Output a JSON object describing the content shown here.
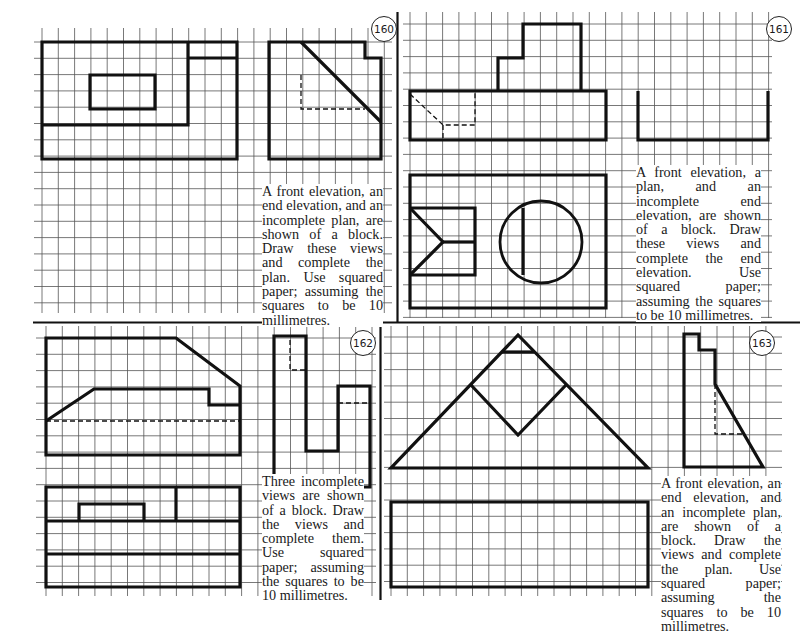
{
  "page": {
    "background": "#ffffff",
    "ink": "#111111",
    "grid_color": "#555555",
    "grid_spacing_px": 16.3
  },
  "exercises": [
    {
      "number": "160",
      "caption": "A front elevation, an end elevation, and an incomplete plan, are shown of a block. Draw these views and complete the plan. Use squared paper; assuming the squares to be 10 millimetres."
    },
    {
      "number": "161",
      "caption": "A front elevation, a plan, and an incomplete end elevation, are shown of a block. Draw these views and complete the end elevation. Use squared paper; assuming the squares to be 10 millimetres."
    },
    {
      "number": "162",
      "caption": "Three incomplete views are shown of a block. Draw the views and complete them. Use squared paper; assuming the squares to be 10 millimetres."
    },
    {
      "number": "163",
      "caption": "A front elevation, an end elevation, and an incomplete plan, are shown of a block. Draw the views and complete the plan. Use squared paper; assuming the squares to be 10 millimetres."
    }
  ],
  "grids": [
    {
      "x0": 34,
      "x1": 392,
      "y0": 28,
      "y1": 313,
      "ox": 42,
      "oy": 42
    },
    {
      "x0": 403,
      "x1": 772,
      "y0": 12,
      "y1": 318,
      "ox": 410,
      "oy": 24
    },
    {
      "x0": 36,
      "x1": 376,
      "y0": 326,
      "y1": 596,
      "ox": 46,
      "oy": 338
    },
    {
      "x0": 384,
      "x1": 782,
      "y0": 326,
      "y1": 596,
      "ox": 391,
      "oy": 337
    }
  ],
  "dividers": [
    {
      "x1": 397.5,
      "y1": 12,
      "x2": 397.5,
      "y2": 322
    },
    {
      "x1": 33,
      "y1": 322.5,
      "x2": 800,
      "y2": 322.5
    },
    {
      "x1": 380.5,
      "y1": 322,
      "x2": 380.5,
      "y2": 600
    }
  ],
  "drawing": {
    "thick": [
      "M42,42 H237 V159 H42 Z",
      "M188,42 V125 H42",
      "M188,58 H237",
      "M90,75 H155 V109 H90 Z",
      "M269,42 H365 V58 H381 V159 H269 Z",
      "M301,42 L381,122",
      "M410,91 H606 V140 H410 Z",
      "M498,91 V58 H523 V24 H581 V91",
      "M638,91 V140 H768 V91",
      "M410,175 H606 V308 H410 Z",
      "M410,208 H475 V275 H410",
      "M410,208 L443,242 L410,275",
      "M443,242 H475",
      "M523,208 V275",
      "M46,338 H176 L240,386 V455 H46 Z",
      "M46,421 L94,389 H209 V405 H240",
      "M274,336 H306 V451 H338 V386 H370 V487 H274 Z",
      "M46,487 H240 V587 H46 Z",
      "M46,521 H240",
      "M46,554 H240",
      "M79,521 V504 H144 V521",
      "M176,487 V521",
      "M518,335 L391,468 H648 Z",
      "M502,352 H534",
      "M471,385 L518,435 L566,385",
      "M684,334 H699 V350 H715 V384 L763,467 H684 Z",
      "M391,502 H648 V587 H391 Z"
    ],
    "dashed": [
      "M301,75 V109 H365",
      "M410,94 L443,125 H475 V91",
      "M443,125 V140",
      "M46,421 H240",
      "M290,340 V370 H306",
      "M338,403 H370",
      "M715,384 V434 H744"
    ],
    "circles": [
      {
        "cx": 541,
        "cy": 242,
        "r": 41
      }
    ]
  },
  "badges": [
    {
      "x": 371,
      "y": 16
    },
    {
      "x": 766,
      "y": 16
    },
    {
      "x": 350,
      "y": 330
    },
    {
      "x": 749,
      "y": 330
    }
  ],
  "captions_layout": [
    {
      "left": 262,
      "top": 184,
      "width": 121
    },
    {
      "left": 636,
      "top": 165,
      "width": 125
    },
    {
      "left": 262,
      "top": 474,
      "width": 102
    },
    {
      "left": 661,
      "top": 476,
      "width": 120
    }
  ]
}
